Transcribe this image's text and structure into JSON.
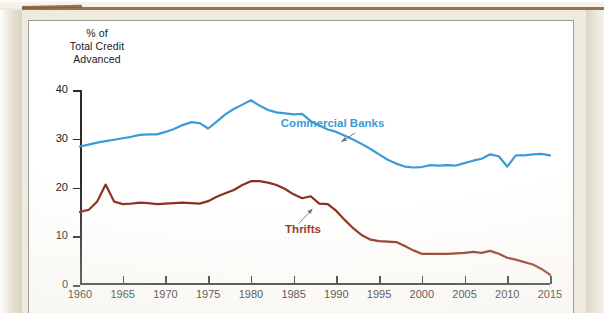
{
  "page": {
    "background_color": "#eeeade",
    "rule_color": "#8a5a3b",
    "card_background": "#ffffff",
    "card_border_color": "#9a9a96"
  },
  "axis_caption": {
    "line1": "% of",
    "line2": "Total Credit",
    "line3": "Advanced"
  },
  "annotations": [
    {
      "name": "commercial-banks",
      "label": "Commercial Banks",
      "color": "#3a9bd9",
      "x": 1983.5,
      "y": 33.0
    },
    {
      "name": "thrifts",
      "label": "Thrifts",
      "color": "#8c2f1e",
      "x": 1984.0,
      "y": 11.2
    }
  ],
  "chart_data": {
    "type": "line",
    "title": "",
    "subtitle": "",
    "xlabel": "",
    "ylabel": "% of Total Credit Advanced",
    "xlim": [
      1960,
      2015
    ],
    "ylim": [
      0,
      40
    ],
    "xticks": [
      1960,
      1965,
      1970,
      1975,
      1980,
      1985,
      1990,
      1995,
      2000,
      2005,
      2010,
      2015
    ],
    "xtick_labels": [
      "1960",
      "1965",
      "1970",
      "1975",
      "1980",
      "1985",
      "1990",
      "1995",
      "2000",
      "2005",
      "2010",
      "2015"
    ],
    "yticks": [
      0,
      10,
      20,
      30,
      40
    ],
    "ytick_labels": [
      "0",
      "10",
      "20",
      "30",
      "40"
    ],
    "grid": false,
    "legend": "inline-annotations",
    "series": [
      {
        "name": "Commercial Banks",
        "color": "#3a9bd9",
        "x": [
          1960,
          1961,
          1962,
          1963,
          1964,
          1965,
          1966,
          1967,
          1968,
          1969,
          1970,
          1971,
          1972,
          1973,
          1974,
          1975,
          1976,
          1977,
          1978,
          1979,
          1980,
          1981,
          1982,
          1983,
          1984,
          1985,
          1986,
          1987,
          1988,
          1989,
          1990,
          1991,
          1992,
          1993,
          1994,
          1995,
          1996,
          1997,
          1998,
          1999,
          2000,
          2001,
          2002,
          2003,
          2004,
          2005,
          2006,
          2007,
          2008,
          2009,
          2010,
          2011,
          2012,
          2013,
          2014,
          2015
        ],
        "values": [
          28.4,
          28.8,
          29.2,
          29.5,
          29.8,
          30.1,
          30.4,
          30.8,
          30.9,
          30.9,
          31.4,
          32.0,
          32.8,
          33.4,
          33.2,
          32.1,
          33.5,
          35.0,
          36.1,
          37.0,
          37.9,
          36.8,
          35.9,
          35.4,
          35.2,
          35.0,
          35.1,
          33.6,
          32.7,
          31.9,
          31.4,
          30.6,
          29.8,
          28.9,
          27.9,
          26.8,
          25.7,
          24.9,
          24.3,
          24.1,
          24.2,
          24.6,
          24.5,
          24.6,
          24.5,
          25.0,
          25.5,
          25.9,
          26.8,
          26.4,
          24.3,
          26.6,
          26.6,
          26.8,
          26.9,
          26.6
        ]
      },
      {
        "name": "Thrifts",
        "color": "#8c2f1e",
        "x": [
          1960,
          1961,
          1962,
          1963,
          1964,
          1965,
          1966,
          1967,
          1968,
          1969,
          1970,
          1971,
          1972,
          1973,
          1974,
          1975,
          1976,
          1977,
          1978,
          1979,
          1980,
          1981,
          1982,
          1983,
          1984,
          1985,
          1986,
          1987,
          1988,
          1989,
          1990,
          1991,
          1992,
          1993,
          1994,
          1995,
          1996,
          1997,
          1998,
          1999,
          2000,
          2001,
          2002,
          2003,
          2004,
          2005,
          2006,
          2007,
          2008,
          2009,
          2010,
          2011,
          2012,
          2013,
          2014,
          2015
        ],
        "values": [
          15.0,
          15.4,
          17.1,
          20.6,
          17.1,
          16.6,
          16.7,
          16.9,
          16.8,
          16.6,
          16.7,
          16.8,
          16.9,
          16.8,
          16.7,
          17.2,
          18.1,
          18.8,
          19.5,
          20.5,
          21.3,
          21.3,
          21.0,
          20.5,
          19.7,
          18.6,
          17.8,
          18.2,
          16.7,
          16.6,
          15.2,
          13.3,
          11.6,
          10.2,
          9.3,
          9.0,
          8.9,
          8.8,
          8.0,
          7.1,
          6.4,
          6.4,
          6.4,
          6.4,
          6.5,
          6.6,
          6.8,
          6.6,
          7.0,
          6.4,
          5.6,
          5.2,
          4.7,
          4.2,
          3.3,
          2.1
        ]
      }
    ]
  }
}
